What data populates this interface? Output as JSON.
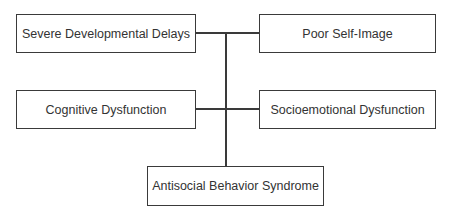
{
  "diagram": {
    "type": "hierarchy-connector",
    "nodes": [
      {
        "id": "severe",
        "label": "Severe Developmental Delays"
      },
      {
        "id": "poor",
        "label": "Poor Self-Image"
      },
      {
        "id": "cognitive",
        "label": "Cognitive Dysfunction"
      },
      {
        "id": "socio",
        "label": "Socioemotional Dysfunction"
      },
      {
        "id": "antisocial",
        "label": "Antisocial Behavior Syndrome"
      }
    ],
    "edges": [
      {
        "from": "severe",
        "to": "antisocial"
      },
      {
        "from": "poor",
        "to": "antisocial"
      },
      {
        "from": "cognitive",
        "to": "antisocial"
      },
      {
        "from": "socio",
        "to": "antisocial"
      }
    ],
    "colors": {
      "line": "#3a3a3a",
      "text": "#333333",
      "background": "#ffffff"
    }
  }
}
